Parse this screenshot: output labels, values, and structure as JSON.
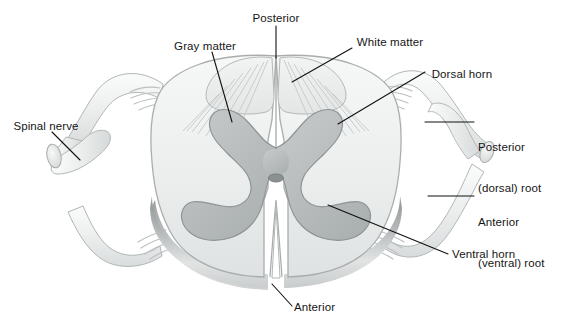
{
  "figure": {
    "type": "anatomical-illustration",
    "width": 571,
    "height": 325,
    "background_color": "#ffffff"
  },
  "colors": {
    "white_matter_fill": "#e9ebeb",
    "white_matter_light": "#f4f5f5",
    "gray_matter_fill": "#b9bdbe",
    "gray_matter_stroke": "#8e9395",
    "outline": "#a7abac",
    "nerve_fill": "#eef0f0",
    "nerve_stroke": "#b0b4b5",
    "bevel_shadow": "#9da1a2",
    "central_canal": "#8b9092",
    "leader_line": "#111111",
    "text": "#161616"
  },
  "labels": [
    {
      "id": "posterior-top",
      "text": "Posterior",
      "lines": [
        "Posterior"
      ],
      "x": 276,
      "y": 12,
      "align": "center"
    },
    {
      "id": "gray-matter",
      "text": "Gray matter",
      "lines": [
        "Gray matter"
      ],
      "x": 205,
      "y": 40,
      "align": "center"
    },
    {
      "id": "white-matter",
      "text": "White matter",
      "lines": [
        "White matter"
      ],
      "x": 390,
      "y": 36,
      "align": "center"
    },
    {
      "id": "dorsal-horn",
      "text": "Dorsal horn",
      "lines": [
        "Dorsal horn"
      ],
      "x": 462,
      "y": 68,
      "align": "center"
    },
    {
      "id": "spinal-nerve",
      "text": "Spinal nerve",
      "lines": [
        "Spinal nerve"
      ],
      "x": 44,
      "y": 120,
      "align": "center"
    },
    {
      "id": "posterior-root",
      "text": "Posterior (dorsal) root",
      "lines": [
        "Posterior",
        "(dorsal) root"
      ],
      "x": 478,
      "y": 114,
      "align": "left"
    },
    {
      "id": "anterior-root",
      "text": "Anterior (ventral) root",
      "lines": [
        "Anterior",
        "(ventral) root"
      ],
      "x": 478,
      "y": 189,
      "align": "left"
    },
    {
      "id": "ventral-horn",
      "text": "Ventral horn",
      "lines": [
        "Ventral horn"
      ],
      "x": 452,
      "y": 252,
      "align": "left"
    },
    {
      "id": "anterior-bottom",
      "text": "Anterior",
      "lines": [
        "Anterior"
      ],
      "x": 294,
      "y": 303,
      "align": "left"
    }
  ],
  "structures": [
    {
      "name": "white-matter",
      "description": "Outer butterfly-surrounding pale region of the cord"
    },
    {
      "name": "gray-matter",
      "description": "Central butterfly / H-shaped darker region"
    },
    {
      "name": "dorsal-horn",
      "description": "Posterior projection of gray matter"
    },
    {
      "name": "ventral-horn",
      "description": "Anterior broad projection of gray matter"
    },
    {
      "name": "central-canal",
      "description": "Small oval opening at the centre of the gray commissure"
    },
    {
      "name": "posterior-median-sulcus",
      "description": "Midline groove on the posterior surface"
    },
    {
      "name": "anterior-median-fissure",
      "description": "Deep midline cleft on the anterior surface"
    },
    {
      "name": "posterior-dorsal-root",
      "description": "Sensory root with dorsal root ganglion swelling"
    },
    {
      "name": "anterior-ventral-root",
      "description": "Motor root leaving the ventral surface"
    },
    {
      "name": "spinal-nerve",
      "description": "Mixed nerve formed by union of the two roots, shown cut"
    },
    {
      "name": "rootlets",
      "description": "Fan of small filaments joining cord and root"
    }
  ]
}
